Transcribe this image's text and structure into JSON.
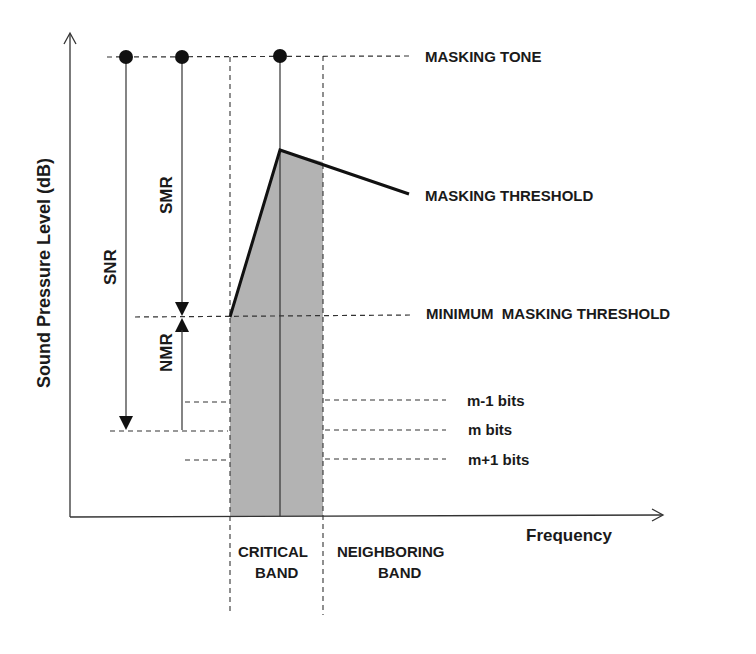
{
  "diagram": {
    "axes": {
      "y_label": "Sound Pressure Level (dB)",
      "x_label": "Frequency"
    },
    "levels": {
      "masking_tone": "MASKING TONE",
      "masking_threshold": "MASKING THRESHOLD",
      "minimum_masking_threshold": "MINIMUM  MASKING THRESHOLD"
    },
    "bits": {
      "m_minus_1": "m-1 bits",
      "m": "m bits",
      "m_plus_1": "m+1 bits"
    },
    "ratios": {
      "snr": "SNR",
      "smr": "SMR",
      "nmr": "NMR"
    },
    "bands": {
      "critical_line1": "CRITICAL",
      "critical_line2": "BAND",
      "neighboring_line1": "NEIGHBORING",
      "neighboring_line2": "BAND"
    },
    "colors": {
      "line": "#1a1a1a",
      "band_fill": "#b3b3b3"
    }
  }
}
